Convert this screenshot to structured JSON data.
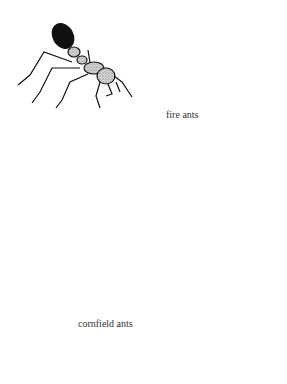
{
  "illustration": {
    "labels": {
      "fire_ants": "fire ants",
      "cornfield_ants": "cornfield ants"
    },
    "figures": [
      {
        "name": "fire-ant-1",
        "style": "stippled, black gaster"
      },
      {
        "name": "fire-ant-2",
        "style": "stippled, black gaster, walking on dotted ground"
      },
      {
        "name": "cornfield-ant-1",
        "style": "black silhouette, side view"
      },
      {
        "name": "cornfield-ant-2",
        "style": "black silhouette, top view"
      }
    ],
    "colors": {
      "background": "#ffffff",
      "ink": "#111111",
      "stipple": "#9a9a9a"
    }
  }
}
